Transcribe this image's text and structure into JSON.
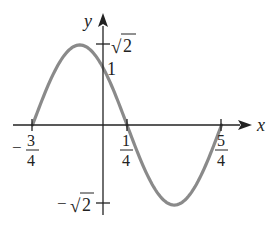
{
  "chart_data": {
    "type": "line",
    "title": "",
    "function": "y = sqrt(2) * sin(pi * (x + 3/4))",
    "xlabel": "x",
    "ylabel": "y",
    "xlim": [
      -1.0,
      1.65
    ],
    "ylim": [
      -1.6,
      1.95
    ],
    "grid": false,
    "x_ticks": [
      {
        "value": -0.75,
        "label": "-3/4"
      },
      {
        "value": 0.25,
        "label": "1/4"
      },
      {
        "value": 1.25,
        "label": "5/4"
      }
    ],
    "y_ticks": [
      {
        "value": 1.4142,
        "label": "√2"
      },
      {
        "value": 1,
        "label": "1"
      },
      {
        "value": -1.4142,
        "label": "-√2"
      }
    ],
    "series": [
      {
        "name": "curve",
        "color": "#8a8a8a",
        "x": [
          -0.75,
          -0.5,
          -0.25,
          0,
          0.25,
          0.5,
          0.75,
          1.0,
          1.25
        ],
        "y": [
          0,
          1,
          1.4142,
          1,
          0,
          -1,
          -1.4142,
          -1,
          0
        ]
      }
    ]
  },
  "labels": {
    "x_axis": "x",
    "y_axis": "y",
    "sqrt2_sym": "√",
    "two": "2",
    "minus": "−",
    "one": "1",
    "three": "3",
    "four": "4",
    "five": "5"
  },
  "colors": {
    "axis": "#222222",
    "curve": "#8a8a8a"
  }
}
